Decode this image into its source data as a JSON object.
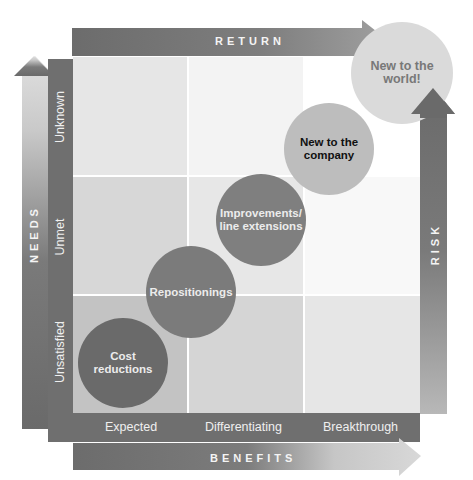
{
  "axes": {
    "top": {
      "title": "RETURN"
    },
    "bottom": {
      "title": "BENEFITS",
      "labels": [
        "Expected",
        "Differentiating",
        "Breakthrough"
      ]
    },
    "left": {
      "title": "NEEDS",
      "labels": [
        "Unsatisfied",
        "Unmet",
        "Unknown"
      ]
    },
    "right": {
      "title": "RISK"
    }
  },
  "bubbles": [
    {
      "label": "Cost reductions",
      "line1": "Cost",
      "line2": "reductions",
      "needs": "Unsatisfied",
      "benefits": "Expected"
    },
    {
      "label": "Repositionings",
      "line1": "Repositionings",
      "line2": "",
      "needs": "Unsatisfied/Unmet",
      "benefits": "Expected/Differentiating"
    },
    {
      "label": "Improvements/ line extensions",
      "line1": "Improvements/",
      "line2": "line extensions",
      "needs": "Unmet",
      "benefits": "Differentiating"
    },
    {
      "label": "New to the company",
      "line1": "New to the",
      "line2": "company",
      "needs": "Unknown",
      "benefits": "Breakthrough"
    },
    {
      "label": "New to the world!",
      "line1": "New to the",
      "line2": "world!",
      "needs": "Beyond Unknown",
      "benefits": "Beyond Breakthrough"
    }
  ],
  "colors": {
    "dark_bar": "#6e6e6e",
    "circle_dark": "#6a6a6a",
    "circle_mid": "#7c7c7c",
    "circle_light": "#a9a9a9",
    "circle_lightest": "#d3d3d3",
    "world_text": "#7a7a7a"
  }
}
